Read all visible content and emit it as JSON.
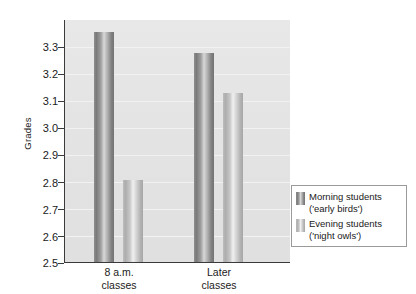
{
  "chart_data": {
    "type": "bar",
    "title": "",
    "xlabel": "",
    "ylabel": "Grades",
    "ylim": [
      2.5,
      3.3
    ],
    "grid": true,
    "legend_position": "right",
    "categories": [
      "8 a.m. classes",
      "Later classes"
    ],
    "category_lines": [
      [
        "8 a.m.",
        "classes"
      ],
      [
        "Later",
        "classes"
      ]
    ],
    "series": [
      {
        "name": "Morning students ('early birds')",
        "name_lines": [
          "Morning students",
          "('early birds')"
        ],
        "color": "#8a8a8a",
        "values": [
          3.26,
          3.19
        ]
      },
      {
        "name": "Evening students ('night owls')",
        "name_lines": [
          "Evening students",
          "('night owls')"
        ],
        "color": "#c4c4c4",
        "values": [
          2.77,
          3.06
        ]
      }
    ],
    "y_ticks": [
      "3.3",
      "3.2",
      "3.1",
      "3.0",
      "2.9",
      "2.8",
      "2.7",
      "2.6",
      "2.5"
    ],
    "y_tick_values": [
      3.3,
      3.2,
      3.1,
      3.0,
      2.9,
      2.8,
      2.7,
      2.6,
      2.5
    ],
    "plot_background": "#e4e4e4",
    "axis_color": "#3a3a3a"
  },
  "legend": {
    "entries": [
      {
        "label_line1": "Morning students",
        "label_line2": "('early birds')"
      },
      {
        "label_line1": "Evening students",
        "label_line2": "('night owls')"
      }
    ]
  }
}
